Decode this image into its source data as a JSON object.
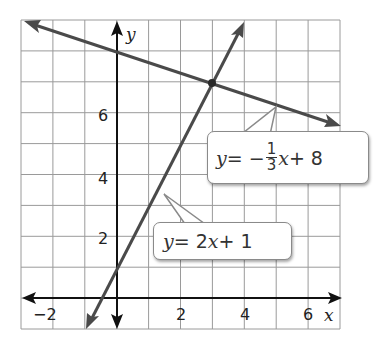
{
  "chart_data": {
    "type": "line",
    "title": "",
    "xlabel": "x",
    "ylabel": "y",
    "xlim": [
      -3,
      7
    ],
    "ylim": [
      -1,
      9
    ],
    "grid": true,
    "x_ticks": [
      -2,
      2,
      4,
      6
    ],
    "y_ticks": [
      2,
      4,
      6
    ],
    "series": [
      {
        "name": "y = -1/3 x + 8",
        "slope": -0.3333,
        "intercept": 8,
        "color": "#4a4a4a",
        "points": [
          [
            -3,
            9
          ],
          [
            7,
            5.6667
          ]
        ]
      },
      {
        "name": "y = 2x + 1",
        "slope": 2,
        "intercept": 1,
        "color": "#4a4a4a",
        "points": [
          [
            -1,
            -1
          ],
          [
            4,
            9
          ]
        ]
      }
    ],
    "annotations": [
      {
        "type": "point",
        "label": "intersection",
        "x": 3,
        "y": 7
      },
      {
        "type": "callout",
        "text": "y = -1/3x + 8",
        "target": [
          4.5,
          6.5
        ]
      },
      {
        "type": "callout",
        "text": "y = 2x + 1",
        "target": [
          1.5,
          4
        ]
      }
    ]
  },
  "labels": {
    "x_axis": "x",
    "y_axis": "y",
    "ticks_x": [
      "−2",
      "2",
      "4",
      "6"
    ],
    "ticks_y": [
      "2",
      "4",
      "6"
    ],
    "eq1": {
      "lhs": "y",
      "eq": " = −",
      "num": "1",
      "den": "3",
      "var": "x",
      "rest": " + 8"
    },
    "eq2": {
      "lhs": "y",
      "eq": " = 2",
      "var": "x",
      "rest": " + 1"
    }
  },
  "colors": {
    "grid": "#9a9a9a",
    "axis": "#111111",
    "line": "#4a4a4a"
  }
}
